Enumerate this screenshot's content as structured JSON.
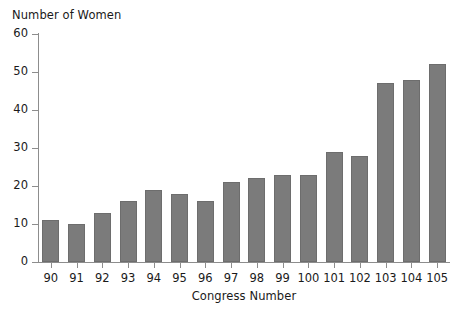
{
  "chart_data": {
    "type": "bar",
    "title": "",
    "xlabel": "Congress Number",
    "ylabel": "Number of Women",
    "categories": [
      "90",
      "91",
      "92",
      "93",
      "94",
      "95",
      "96",
      "97",
      "98",
      "99",
      "100",
      "101",
      "102",
      "103",
      "104",
      "105"
    ],
    "values": [
      11,
      10,
      13,
      16,
      19,
      18,
      16,
      21,
      22,
      23,
      23,
      29,
      28,
      47,
      48,
      52
    ],
    "ylim": [
      0,
      60
    ],
    "yticks": [
      0,
      10,
      20,
      30,
      40,
      50,
      60
    ],
    "ytick_labels": [
      "0",
      "10",
      "20",
      "30",
      "40",
      "50",
      "60"
    ],
    "grid": false,
    "legend": null,
    "bar_color": "#7b7b7b",
    "axis_color": "#8d8d8d",
    "text_color": "#1a1a1a"
  }
}
